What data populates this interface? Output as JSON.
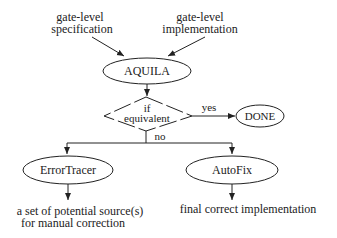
{
  "diagram": {
    "inputs": {
      "spec": {
        "line1": "gate-level",
        "line2": "specification"
      },
      "impl": {
        "line1": "gate-level",
        "line2": "implementation"
      }
    },
    "nodes": {
      "aquila": "AQUILA",
      "decision": {
        "line1": "if",
        "line2": "equivalent"
      },
      "done": "DONE",
      "error_tracer": "ErrorTracer",
      "autofix": "AutoFix"
    },
    "edges": {
      "yes": "yes",
      "no": "no"
    },
    "outputs": {
      "error_tracer": {
        "line1": "a set of potential source(s)",
        "line2": "for manual correction"
      },
      "autofix": "final correct implementation"
    },
    "colors": {
      "stroke": "#222222",
      "background": "#ffffff"
    }
  }
}
